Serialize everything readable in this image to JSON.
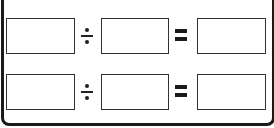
{
  "worksheet": {
    "title": "",
    "rows": [
      {
        "operand_a": "",
        "operator": "÷",
        "operand_b": "",
        "equals": "=",
        "result": ""
      },
      {
        "operand_a": "",
        "operator": "÷",
        "operand_b": "",
        "equals": "=",
        "result": ""
      }
    ]
  },
  "colors": {
    "frame": "#1a1a1a",
    "box_border": "#333333",
    "background": "#ffffff"
  }
}
